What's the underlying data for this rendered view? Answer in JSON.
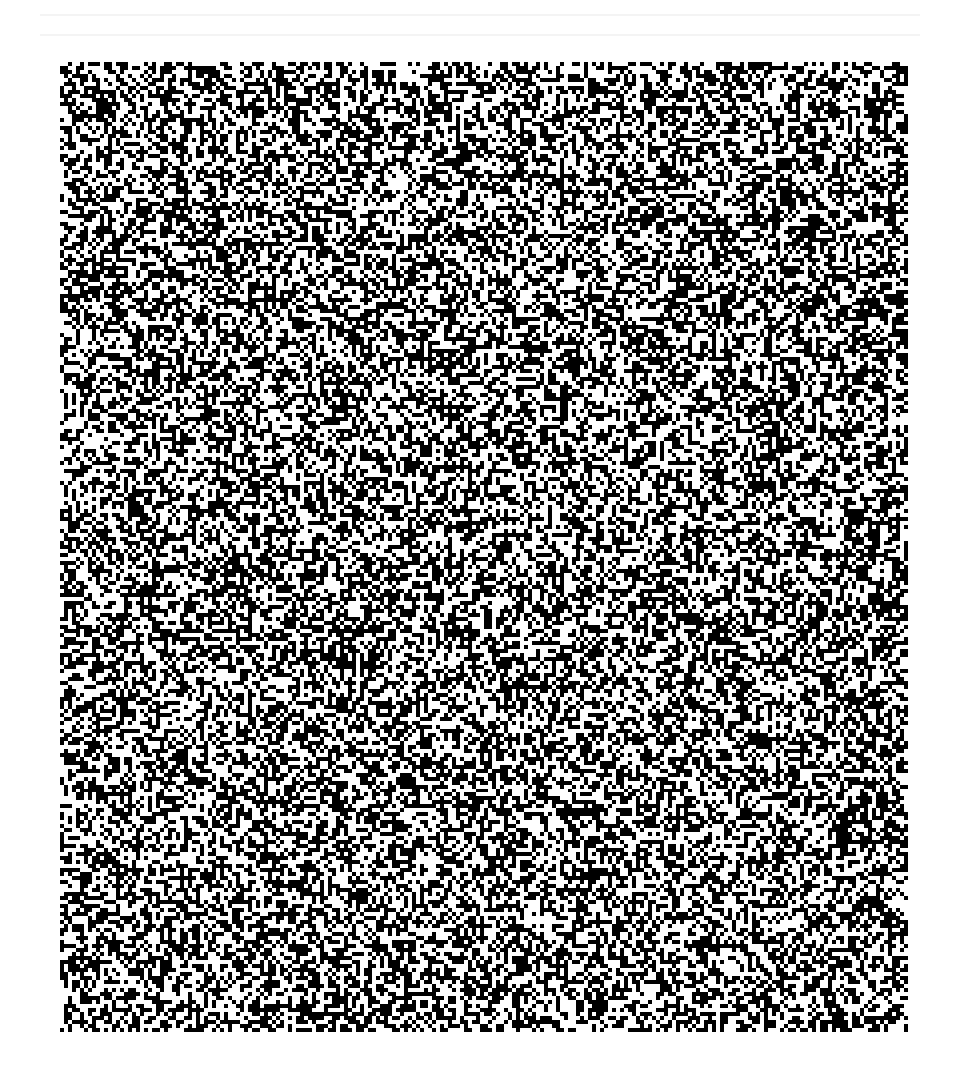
{
  "image": {
    "kind": "random-dot noise pattern",
    "description": "Binary black-and-white random pixel noise field on white background",
    "colors": {
      "foreground": "#000000",
      "background": "#ffffff"
    },
    "fill_density": 0.5,
    "seed": 1087
  }
}
